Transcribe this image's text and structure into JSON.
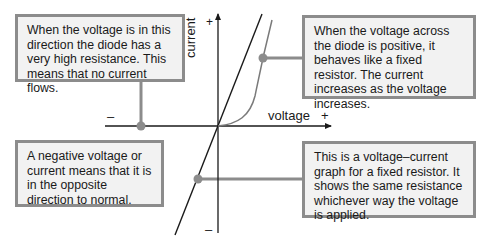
{
  "diagram": {
    "axes": {
      "x_label": "voltage",
      "x_plus": "+",
      "x_minus": "–",
      "y_label": "current",
      "y_plus": "+",
      "y_minus": "–"
    },
    "curves": [
      {
        "name": "fixed resistor",
        "shape": "straight line through origin",
        "color": "#222222"
      },
      {
        "name": "diode",
        "shape": "exponential rise for positive voltage, flat for negative",
        "color": "#777777"
      }
    ],
    "callouts": [
      {
        "id": "diode-reverse",
        "text": "When the voltage is in this direction the diode has a very high resistance. This means that no current flows."
      },
      {
        "id": "diode-forward",
        "text": "When the voltage across the diode is positive, it behaves like a fixed resistor. The current increases as the voltage increases."
      },
      {
        "id": "negative-meaning",
        "text": "A negative voltage or current means that it is in the opposite direction to normal."
      },
      {
        "id": "resistor-graph",
        "text": "This is a voltage–current graph for a fixed resistor. It shows the same resistance whichever way the voltage is applied."
      }
    ],
    "colors": {
      "box_fill": "#f2f2f2",
      "box_border": "#8c8c8c",
      "connector": "#8c8c8c",
      "axis": "#1a1a1a"
    }
  }
}
